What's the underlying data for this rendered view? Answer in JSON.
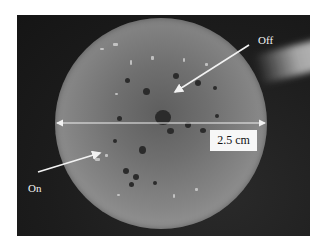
{
  "image": {
    "description": "Photograph of a circular specimen disk with radial deposit pattern and dark spots, with annotation arrows",
    "background_color": "#1c1c1c",
    "disk_color": "#8a8a8a"
  },
  "annotations": {
    "off_label": "Off",
    "on_label": "On",
    "scale_label": "2.5 cm"
  },
  "scale_bar": {
    "type": "double-headed-arrow",
    "value": "2.5 cm",
    "color": "#f0f0f0"
  }
}
